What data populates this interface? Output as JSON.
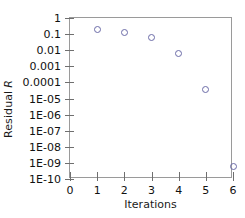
{
  "chart_data": {
    "type": "scatter",
    "title": "",
    "xlabel": "Iterations",
    "ylabel": "Residual R",
    "ylabel_plain": "Residual",
    "ylabel_italic": "R",
    "yscale": "log",
    "xscale": "linear",
    "xlim": [
      0,
      6
    ],
    "ylim": [
      1e-10,
      1
    ],
    "grid": false,
    "legend": false,
    "xticks": [
      0,
      1,
      2,
      3,
      4,
      5,
      6
    ],
    "xticklabels": [
      "0",
      "1",
      "2",
      "3",
      "4",
      "5",
      "6"
    ],
    "yticks": [
      1,
      0.1,
      0.01,
      0.001,
      0.0001,
      1e-05,
      1e-06,
      1e-07,
      1e-08,
      1e-09,
      1e-10
    ],
    "yticklabels": [
      "1",
      "0.1",
      "0.01",
      "0.001",
      "0.0001",
      "1E-05",
      "1E-06",
      "1E-07",
      "1E-08",
      "1E-09",
      "1E-10"
    ],
    "marker_color": "#6b6ba8",
    "marker_style": "open-circle",
    "frame_color": "#9a9a9a",
    "series": [
      {
        "name": "Residual",
        "x": [
          1,
          2,
          3,
          4,
          5,
          6
        ],
        "y": [
          0.2,
          0.12,
          0.06,
          0.006,
          3.5e-05,
          6e-10
        ]
      }
    ]
  }
}
